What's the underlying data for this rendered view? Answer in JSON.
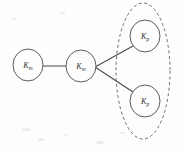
{
  "figure": {
    "background_color": "#fdfdfd",
    "stroke_color": "#4a4a4a",
    "dashed_stroke_color": "#5a5a5a",
    "label_color": "#343434"
  },
  "nodes": [
    {
      "id": "node-km-left",
      "label_base": "K",
      "label_sub": "m",
      "label_full": "K_m",
      "cx": 28,
      "cy": 65,
      "rx": 15,
      "ry": 16
    },
    {
      "id": "node-km-middle",
      "label_base": "K",
      "label_sub": "m",
      "label_full": "K_m",
      "cx": 81,
      "cy": 66,
      "rx": 15,
      "ry": 16
    },
    {
      "id": "node-kp-top",
      "label_base": "K",
      "label_sub": "p",
      "label_full": "K_p",
      "cx": 145,
      "cy": 36,
      "rx": 15,
      "ry": 16
    },
    {
      "id": "node-kp-bottom",
      "label_base": "K",
      "label_sub": "p",
      "label_full": "K_p",
      "cx": 145,
      "cy": 101,
      "rx": 15,
      "ry": 16
    }
  ],
  "edges": [
    {
      "id": "edge-km-left-to-km-middle",
      "from": "node-km-left",
      "to": "node-km-middle",
      "x1": 43,
      "y1": 66,
      "x2": 66,
      "y2": 66,
      "style": "solid"
    },
    {
      "id": "edge-km-middle-to-kp-top",
      "from": "node-km-middle",
      "to": "node-kp-top",
      "x1": 95,
      "y1": 67,
      "x2": 133,
      "y2": 46,
      "style": "solid"
    },
    {
      "id": "edge-km-middle-to-kp-bottom",
      "from": "node-km-middle",
      "to": "node-kp-bottom",
      "x1": 95,
      "y1": 67,
      "x2": 133,
      "y2": 92,
      "style": "solid"
    }
  ],
  "group": {
    "id": "group-kp-cluster",
    "label": "dashed grouping ellipse around the two K_p nodes",
    "cx": 143,
    "cy": 71,
    "rx": 27,
    "ry": 68,
    "style": "dashed",
    "members": [
      "node-kp-top",
      "node-kp-bottom"
    ]
  }
}
